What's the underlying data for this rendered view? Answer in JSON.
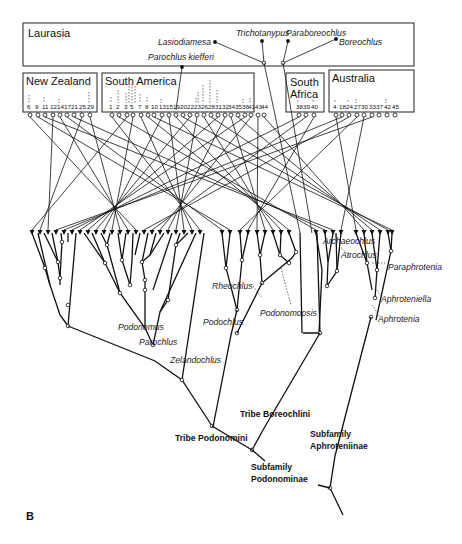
{
  "figure": {
    "panel_label": "B",
    "areas": [
      {
        "name": "Laurasia",
        "nodes": []
      },
      {
        "name": "New Zealand",
        "nodes": [
          "6",
          "9",
          "11",
          "12",
          "14",
          "17",
          "21",
          "25",
          "29"
        ]
      },
      {
        "name": "South America",
        "nodes": [
          "1",
          "2",
          "3",
          "5",
          "7",
          "8",
          "10",
          "13",
          "15",
          "19",
          "20",
          "22",
          "23",
          "26",
          "28",
          "31",
          "32",
          "34",
          "35",
          "36",
          "41",
          "43",
          "44"
        ]
      },
      {
        "name": "South Africa",
        "nodes": [
          "38",
          "39",
          "40"
        ]
      },
      {
        "name": "Australia",
        "nodes": [
          "4",
          "18",
          "24",
          "27",
          "30",
          "33",
          "37",
          "42",
          "45"
        ]
      }
    ],
    "south_africa_line1": "South",
    "south_africa_line2": "Africa",
    "laurasian_taxa": [
      "Lasiodiamesa",
      "Trichotanypus",
      "Paraboreochlus",
      "Boreochlus",
      "Parochlus kiefferi"
    ],
    "genera": [
      "Podonomus",
      "Parochlus",
      "Zelandochlus",
      "Rheochlus",
      "Podochlus",
      "Podonomopsis",
      "Archaeochlus",
      "Atrochlus",
      "Paraphrotenia",
      "Aphroteniella",
      "Aphrotenia"
    ],
    "higher_groups": {
      "tribe_podonomini": "Tribe Podonomini",
      "tribe_boreochlini": "Tribe Boreochlini",
      "subfamily_podonominae_1": "Subfamily",
      "subfamily_podonominae_2": "Podonominae",
      "subfamily_aphroteniinae_1": "Subfamily",
      "subfamily_aphroteniinae_2": "Aphroteniinae"
    },
    "colors": {
      "ink": "#111111",
      "background": "#ffffff"
    }
  }
}
